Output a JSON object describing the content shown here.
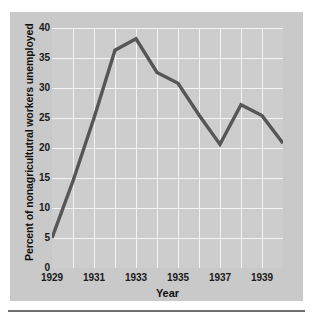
{
  "chart_data": {
    "type": "line",
    "title": "",
    "xlabel": "Year",
    "ylabel": "Percent of nonagricultutral workers unemployed",
    "xlim": [
      1929,
      1940
    ],
    "ylim": [
      0,
      40
    ],
    "grid": true,
    "legend": "none",
    "line_color": "#565656",
    "plot_background": "#cdcdcd",
    "panel_background": "#c9c9c9",
    "gridline_color": "#f4f4f4",
    "x_tick_labels": [
      "1929",
      "1931",
      "1933",
      "1935",
      "1937",
      "1939"
    ],
    "x_tick_values": [
      1929,
      1931,
      1933,
      1935,
      1937,
      1939
    ],
    "y_tick_labels": [
      "0",
      "5",
      "10",
      "15",
      "20",
      "25",
      "30",
      "35",
      "40"
    ],
    "y_tick_values": [
      0,
      5,
      10,
      15,
      20,
      25,
      30,
      35,
      40
    ],
    "x": [
      1929,
      1930,
      1931,
      1932,
      1933,
      1934,
      1935,
      1936,
      1937,
      1938,
      1939,
      1940
    ],
    "values": [
      5.0,
      14.5,
      25.0,
      36.3,
      38.2,
      32.6,
      30.8,
      25.5,
      20.6,
      27.2,
      25.4,
      20.8
    ],
    "series": [
      {
        "name": "Percent of nonagricultutral workers unemployed",
        "values": [
          5.0,
          14.5,
          25.0,
          36.3,
          38.2,
          32.6,
          30.8,
          25.5,
          20.6,
          27.2,
          25.4,
          20.8
        ]
      }
    ]
  }
}
